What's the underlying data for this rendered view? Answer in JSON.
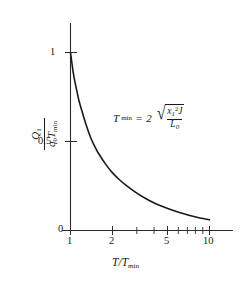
{
  "chart_data": {
    "type": "line",
    "title": "",
    "xlabel": "T/T_min",
    "ylabel": "Q_1/(q_0 T_min)",
    "xscale": "log",
    "yscale": "linear",
    "xlim": [
      1,
      10
    ],
    "ylim": [
      0,
      1.08
    ],
    "grid": false,
    "legend": null,
    "x_tick_labels": [
      "1",
      "2",
      "5",
      "10"
    ],
    "x_tick_values": [
      1,
      2,
      5,
      10
    ],
    "x_minor_ticks": [
      3,
      4,
      6,
      7,
      8,
      9
    ],
    "y_tick_labels": [
      "0",
      "0.5",
      "1"
    ],
    "y_tick_values": [
      0,
      0.5,
      1
    ],
    "series": [
      {
        "name": "Q1/(q0 Tmin)",
        "x": [
          1.0,
          1.05,
          1.1,
          1.15,
          1.2,
          1.3,
          1.4,
          1.5,
          1.6,
          1.8,
          2.0,
          2.25,
          2.5,
          3.0,
          3.5,
          4.0,
          4.5,
          5.0,
          6.0,
          7.0,
          8.0,
          9.0,
          10.0
        ],
        "values": [
          1.0,
          0.88,
          0.8,
          0.73,
          0.68,
          0.59,
          0.52,
          0.47,
          0.43,
          0.37,
          0.325,
          0.285,
          0.255,
          0.21,
          0.178,
          0.155,
          0.137,
          0.123,
          0.102,
          0.087,
          0.076,
          0.067,
          0.06
        ]
      }
    ],
    "annotations": [
      {
        "name": "tmin-formula",
        "text": "T_min = 2 sqrt( x_1^2 J / L_0 )",
        "x_frac": 0.45,
        "y_frac": 0.63
      }
    ]
  },
  "axes": {
    "y_label": {
      "numerator": "Q",
      "numerator_sub": "1",
      "denominator_1": "q",
      "denominator_1_sub": "0",
      "denominator_2": "T",
      "denominator_2_sub": "min"
    },
    "x_label": {
      "left": "T",
      "slash": "/",
      "right": "T",
      "right_sub": "min"
    },
    "y_ticks": [
      {
        "label": "1",
        "value": 1
      },
      {
        "label": "0.5",
        "value": 0.5
      },
      {
        "label": "0",
        "value": 0
      }
    ],
    "x_ticks": [
      {
        "label": "1",
        "value": 1
      },
      {
        "label": "2",
        "value": 2
      },
      {
        "label": "5",
        "value": 5
      },
      {
        "label": "10",
        "value": 10
      }
    ]
  },
  "formula": {
    "lhs": "T",
    "lhs_sub": "min",
    "equals": "=",
    "coefficient": "2",
    "radical_numerator_var": "x",
    "radical_numerator_sub": "1",
    "radical_numerator_sup": "2",
    "radical_numerator_var2": "J",
    "radical_denominator_var": "L",
    "radical_denominator_sub": "0"
  },
  "colors": {
    "curve": "#1a1a1a",
    "axis": "#2b2b2b",
    "background": "#ffffff",
    "text": "#1a1a1a"
  }
}
